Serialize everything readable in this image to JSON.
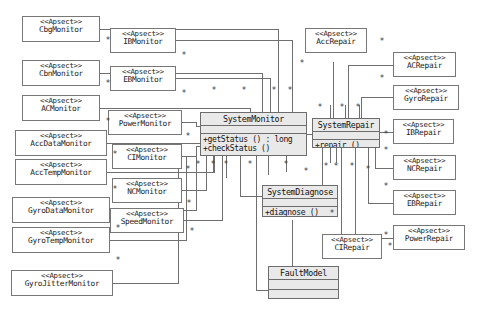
{
  "diagram": {
    "stereotype": "<<Apsect>>",
    "multiplicity": "*",
    "colors": {
      "class_fill": "#e9e9e9",
      "aspect_fill": "#ffffff",
      "line": "#6f6f6f",
      "border": "#777777",
      "text": "#1b1b1b",
      "background": "#ffffff"
    }
  },
  "aspects": {
    "left": [
      {
        "stereotype": "<<Apsect>>",
        "name": "CbgMonitor"
      },
      {
        "stereotype": "<<Apsect>>",
        "name": "CbnMonitor"
      },
      {
        "stereotype": "<<Apsect>>",
        "name": "ACMonitor"
      },
      {
        "stereotype": "<<Apsect>>",
        "name": "AccDataMonitor"
      },
      {
        "stereotype": "<<Apsect>>",
        "name": "AccTempMonitor"
      },
      {
        "stereotype": "<<Apsect>>",
        "name": "GyroDataMonitor"
      },
      {
        "stereotype": "<<Apsect>>",
        "name": "GyroTempMonitor"
      },
      {
        "stereotype": "<<Apsect>>",
        "name": "GyroJitterMonitor"
      }
    ],
    "middle": [
      {
        "stereotype": "<<Apsect>>",
        "name": "IBMonitor"
      },
      {
        "stereotype": "<<Apsect>>",
        "name": "EBMonitor"
      },
      {
        "stereotype": "<<Apsect>>",
        "name": "PowerMonitor"
      },
      {
        "stereotype": "<<Apsect>>",
        "name": "CIMonitor"
      },
      {
        "stereotype": "<<Apsect>>",
        "name": "NCMonitor"
      },
      {
        "stereotype": "<<Apsect>>",
        "name": "SpeedMonitor"
      }
    ],
    "right_inner": [
      {
        "stereotype": "<<Apsect>>",
        "name": "AccRepair"
      },
      {
        "stereotype": "<<Apsect>>",
        "name": "CIRepair"
      }
    ],
    "right_outer": [
      {
        "stereotype": "<<Apsect>>",
        "name": "ACRepair"
      },
      {
        "stereotype": "<<Apsect>>",
        "name": "GyroRepair"
      },
      {
        "stereotype": "<<Apsect>>",
        "name": "IBRepair"
      },
      {
        "stereotype": "<<Apsect>>",
        "name": "NCRepair"
      },
      {
        "stereotype": "<<Apsect>>",
        "name": "EBRepair"
      },
      {
        "stereotype": "<<Apsect>>",
        "name": "PowerRepair"
      }
    ]
  },
  "classes": {
    "system_monitor": {
      "name": "SystemMonitor",
      "operations": [
        "+getStatus () : long",
        "+checkStatus ()"
      ]
    },
    "system_repair": {
      "name": "SystemRepair",
      "operations": [
        "+repair ()"
      ]
    },
    "system_diagnose": {
      "name": "SystemDiagnose",
      "operations": [
        "+diagnose ()"
      ]
    },
    "fault_model": {
      "name": "FaultModel",
      "operations": []
    }
  }
}
